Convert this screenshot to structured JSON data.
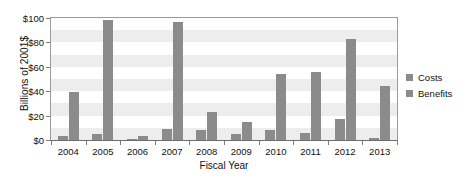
{
  "chart_data": {
    "type": "bar",
    "title": "",
    "xlabel": "Fiscal Year",
    "ylabel": "Billions of 2001$",
    "categories": [
      "2004",
      "2005",
      "2006",
      "2007",
      "2008",
      "2009",
      "2010",
      "2011",
      "2012",
      "2013"
    ],
    "series": [
      {
        "name": "Costs",
        "values": [
          3,
          5,
          1,
          9,
          8,
          5,
          8,
          6,
          17,
          2
        ]
      },
      {
        "name": "Benefits",
        "values": [
          39,
          98,
          3,
          97,
          23,
          15,
          54,
          56,
          83,
          44
        ]
      }
    ],
    "ylim": [
      0,
      100
    ],
    "yticks": [
      0,
      20,
      40,
      60,
      80,
      100
    ],
    "ytick_labels": [
      "$0",
      "$20",
      "$40",
      "$60",
      "$80",
      "$100"
    ],
    "grid": "horizontal-bands",
    "legend_position": "right",
    "colors": {
      "bar": "#8b8b8b",
      "axis": "#7a7a7a",
      "band": "#ededed",
      "text": "#111111"
    }
  },
  "legend": {
    "items": [
      {
        "label": "Costs"
      },
      {
        "label": "Benefits"
      }
    ]
  }
}
